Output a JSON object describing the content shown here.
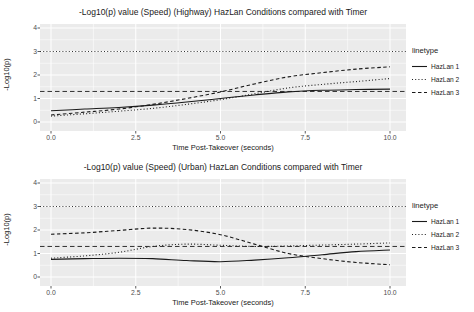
{
  "colors": {
    "background": "#ffffff",
    "panel_bg": "#ebebeb",
    "grid": "#ffffff",
    "line": "#1a1a1a",
    "tick_text": "#4d4d4d",
    "title_text": "#1a1a1a"
  },
  "chart_data": [
    {
      "type": "line",
      "title": "-Log10(p) value (Speed) (Highway) HazLan Conditions compared with Timer",
      "xlabel": "Time Post-Takeover (seconds)",
      "ylabel": "-Log10(p)",
      "xlim": [
        -0.32,
        10.47
      ],
      "ylim": [
        -0.34,
        4.17
      ],
      "grid": true,
      "x": [
        0,
        1,
        2,
        3,
        4,
        5,
        6,
        7,
        8,
        9,
        10
      ],
      "series": [
        {
          "name": "HazLan 1",
          "linetype": "solid",
          "values": [
            0.48,
            0.55,
            0.62,
            0.72,
            0.85,
            1.0,
            1.15,
            1.28,
            1.35,
            1.38,
            1.4
          ]
        },
        {
          "name": "HazLan 2",
          "linetype": "dotted",
          "values": [
            0.25,
            0.35,
            0.46,
            0.58,
            0.75,
            0.95,
            1.2,
            1.45,
            1.6,
            1.72,
            1.85
          ]
        },
        {
          "name": "HazLan 3",
          "linetype": "dashed",
          "values": [
            0.3,
            0.42,
            0.55,
            0.75,
            1.0,
            1.28,
            1.62,
            1.92,
            2.1,
            2.25,
            2.35
          ]
        }
      ],
      "reference_lines": [
        {
          "y": 3.0,
          "linetype": "dotted"
        },
        {
          "y": 1.3,
          "linetype": "dashed"
        }
      ],
      "x_ticks": [
        {
          "value": 0,
          "label": "0.0"
        },
        {
          "value": 2.5,
          "label": "2.5"
        },
        {
          "value": 5,
          "label": "5.0"
        },
        {
          "value": 7.5,
          "label": "7.5"
        },
        {
          "value": 10,
          "label": "10.0"
        }
      ],
      "y_ticks": [
        {
          "value": 0,
          "label": "0"
        },
        {
          "value": 1,
          "label": "1"
        },
        {
          "value": 2,
          "label": "2"
        },
        {
          "value": 3,
          "label": "3"
        },
        {
          "value": 4,
          "label": "4"
        }
      ],
      "legend": {
        "title": "linetype",
        "position": "right"
      }
    },
    {
      "type": "line",
      "title": "-Log10(p) value (Speed) (Urban) HazLan Conditions compared with Timer",
      "xlabel": "Time Post-Takeover (seconds)",
      "ylabel": "-Log10(p)",
      "xlim": [
        -0.32,
        10.47
      ],
      "ylim": [
        -0.34,
        4.17
      ],
      "grid": true,
      "x": [
        0,
        1,
        2,
        3,
        4,
        5,
        6,
        7,
        8,
        9,
        10
      ],
      "series": [
        {
          "name": "HazLan 1",
          "linetype": "solid",
          "values": [
            0.75,
            0.78,
            0.8,
            0.78,
            0.7,
            0.65,
            0.72,
            0.82,
            0.95,
            1.08,
            1.15
          ]
        },
        {
          "name": "HazLan 2",
          "linetype": "dotted",
          "values": [
            0.8,
            0.9,
            1.05,
            1.3,
            1.4,
            1.35,
            1.3,
            1.32,
            1.36,
            1.4,
            1.45
          ]
        },
        {
          "name": "HazLan 3",
          "linetype": "dashed",
          "values": [
            1.82,
            1.88,
            1.98,
            2.08,
            2.02,
            1.8,
            1.4,
            1.0,
            0.78,
            0.62,
            0.52
          ]
        }
      ],
      "reference_lines": [
        {
          "y": 3.0,
          "linetype": "dotted"
        },
        {
          "y": 1.3,
          "linetype": "dashed"
        }
      ],
      "x_ticks": [
        {
          "value": 0,
          "label": "0.0"
        },
        {
          "value": 2.5,
          "label": "2.5"
        },
        {
          "value": 5,
          "label": "5.0"
        },
        {
          "value": 7.5,
          "label": "7.5"
        },
        {
          "value": 10,
          "label": "10.0"
        }
      ],
      "y_ticks": [
        {
          "value": 0,
          "label": "0"
        },
        {
          "value": 1,
          "label": "1"
        },
        {
          "value": 2,
          "label": "2"
        },
        {
          "value": 3,
          "label": "3"
        },
        {
          "value": 4,
          "label": "4"
        }
      ],
      "legend": {
        "title": "linetype",
        "position": "right"
      }
    }
  ]
}
